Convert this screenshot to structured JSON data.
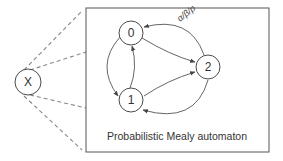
{
  "diagram": {
    "source_node": {
      "label": "X"
    },
    "box": {
      "caption": "Probabilistic Mealy automaton"
    },
    "states": [
      {
        "id": "0",
        "label": "0"
      },
      {
        "id": "1",
        "label": "1"
      },
      {
        "id": "2",
        "label": "2"
      }
    ],
    "edges": [
      {
        "from": "0",
        "to": "2"
      },
      {
        "from": "2",
        "to": "0",
        "label": "α/β/p"
      },
      {
        "from": "0",
        "to": "1"
      },
      {
        "from": "1",
        "to": "0"
      },
      {
        "from": "1",
        "to": "2"
      },
      {
        "from": "2",
        "to": "1"
      }
    ],
    "colors": {
      "stroke": "#4a4a4a",
      "dashed": "#888888",
      "text": "#333333"
    }
  }
}
